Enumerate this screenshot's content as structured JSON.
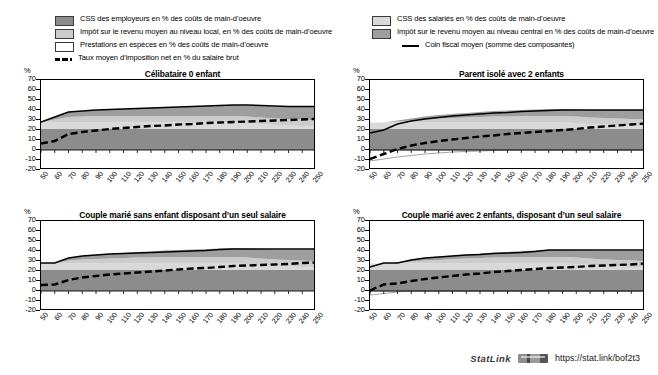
{
  "legend": {
    "left_items": [
      {
        "swatch": "dark-gray",
        "label": "CSS des employeurs en % des coûts de main-d’oeuvre"
      },
      {
        "swatch": "light-gray",
        "label": "Impôt sur le revenu moyen au niveau local, en % des coûts de main-d’oeuvre"
      },
      {
        "swatch": "white",
        "label": "Prestations en espèces en % des coûts de main-d’oeuvre"
      },
      {
        "swatch": "dashed-line",
        "label": "Taux moyen d’imposition net en % du salaire brut"
      }
    ],
    "right_items": [
      {
        "swatch": "lighter-gray",
        "label": "CSS des salariés en % des coûts de main-d’oeuvre"
      },
      {
        "swatch": "mid-gray",
        "label": "Impôt sur le revenu moyen au niveau central en %  des coûts de main-d’oeuvre"
      },
      {
        "swatch": "solid-line",
        "label": "Coin fiscal moyen (somme des composantes)"
      }
    ]
  },
  "footer": {
    "statlink_word": "StatLink",
    "url": "https://stat.link/bof2t3"
  },
  "axis": {
    "unit": "%",
    "yticks": [
      "70",
      "60",
      "50",
      "40",
      "30",
      "20",
      "10",
      "0",
      "-10",
      "-20"
    ],
    "xticks": [
      "50",
      "60",
      "70",
      "80",
      "90",
      "100",
      "110",
      "120",
      "130",
      "140",
      "150",
      "160",
      "170",
      "180",
      "190",
      "200",
      "210",
      "220",
      "230",
      "240",
      "250"
    ]
  },
  "chart_data": {
    "type": "area",
    "xlabel": "",
    "ylabel": "%",
    "xlim": [
      50,
      250
    ],
    "ylim": [
      -20,
      70
    ],
    "grid": false,
    "legend_position": "top",
    "x": [
      50,
      60,
      70,
      80,
      90,
      100,
      110,
      120,
      130,
      140,
      150,
      160,
      170,
      180,
      190,
      200,
      210,
      220,
      230,
      240,
      250
    ],
    "colors": {
      "employer_ssc": "#8c8c8c",
      "employee_ssc": "#d9d9d9",
      "income_tax_central": "#9e9e9e",
      "income_tax_local": "#cccccc",
      "cash_benefits": "#ffffff",
      "net_tax_rate_line": "#000000",
      "tax_wedge_line": "#000000"
    },
    "panels": [
      {
        "title": "Célibataire 0 enfant",
        "series": [
          {
            "name": "CSS des employeurs en % des coûts de main-d’oeuvre",
            "key": "employer_ssc",
            "stack": "positive",
            "values": [
              21,
              21,
              21,
              21,
              21,
              21,
              21,
              21,
              21,
              21,
              21,
              21,
              21,
              21,
              21,
              21,
              21,
              21,
              21,
              21,
              21
            ]
          },
          {
            "name": "CSS des salariés en % des coûts de main-d’oeuvre",
            "key": "employee_ssc",
            "stack": "positive",
            "values": [
              6.5,
              6.5,
              6.5,
              6.5,
              6.5,
              6.5,
              6.5,
              6.5,
              6.5,
              6.5,
              6.5,
              6.5,
              6.5,
              6.5,
              6.5,
              6,
              5,
              4,
              3.5,
              3,
              2.5
            ]
          },
          {
            "name": "Impôt sur le revenu moyen au niveau local, en % des coûts de main-d’oeuvre",
            "key": "income_tax_local",
            "stack": "positive",
            "values": [
              0.5,
              3,
              5.5,
              6,
              6.5,
              6.5,
              6.5,
              6.5,
              6.5,
              6.5,
              6.5,
              6.5,
              6.5,
              6.5,
              6.5,
              6.5,
              6.5,
              6.5,
              6.5,
              6.5,
              6.5
            ]
          },
          {
            "name": "Impôt sur le revenu moyen au niveau central en %  des coûts de main-d’oeuvre",
            "key": "income_tax_central",
            "stack": "positive",
            "values": [
              0,
              2.5,
              5,
              5.5,
              6,
              6.5,
              7,
              7.5,
              8,
              8.5,
              9,
              9.5,
              10,
              10.5,
              11,
              11,
              11.5,
              12,
              12.5,
              13,
              13.5
            ]
          },
          {
            "name": "Prestations en espèces en % des coûts de main-d’oeuvre",
            "key": "cash_benefits",
            "stack": "negative",
            "values": [
              0,
              0,
              0,
              0,
              0,
              0,
              0,
              0,
              0,
              0,
              0,
              0,
              0,
              0,
              0,
              0,
              0,
              0,
              0,
              0,
              0
            ]
          }
        ],
        "lines": [
          {
            "name": "Coin fiscal moyen (somme des composantes)",
            "key": "tax_wedge_line",
            "style": "solid",
            "values": [
              28,
              33,
              38,
              39,
              40,
              40.5,
              41,
              41.5,
              42,
              42.5,
              43,
              43.5,
              44,
              44.5,
              45,
              45,
              44.5,
              44,
              43.5,
              43.5,
              43.5
            ]
          },
          {
            "name": "Taux moyen d’imposition net en % du salaire brut",
            "key": "net_tax_rate_line",
            "style": "dashed",
            "values": [
              6.5,
              9,
              16,
              18,
              19.5,
              21,
              22,
              23,
              24,
              24.5,
              25.5,
              26,
              27,
              27.5,
              28,
              28.5,
              29,
              29.5,
              30,
              30.5,
              31
            ]
          }
        ]
      },
      {
        "title": "Parent isolé avec 2 enfants",
        "series": [
          {
            "name": "CSS des employeurs en % des coûts de main-d’oeuvre",
            "key": "employer_ssc",
            "stack": "positive",
            "values": [
              21,
              21,
              21,
              21,
              21,
              21,
              21,
              21,
              21,
              21,
              21,
              21,
              21,
              21,
              21,
              21,
              21,
              21,
              21,
              21,
              21
            ]
          },
          {
            "name": "CSS des salariés en % des coûts de main-d’oeuvre",
            "key": "employee_ssc",
            "stack": "positive",
            "values": [
              6.5,
              6.5,
              6.5,
              6.5,
              6.5,
              6.5,
              6.5,
              6.5,
              6.5,
              6.5,
              6.5,
              6.5,
              6.5,
              6.5,
              6.5,
              6,
              5,
              4.5,
              4,
              3.5,
              3
            ]
          },
          {
            "name": "Impôt sur le revenu moyen au niveau local, en % des coûts de main-d’oeuvre",
            "key": "income_tax_local",
            "stack": "positive",
            "values": [
              0,
              0,
              1,
              2,
              3,
              4,
              4.5,
              5,
              5.5,
              6,
              6,
              6.5,
              6.5,
              6.5,
              6.5,
              6.5,
              6.5,
              6.5,
              6.5,
              6.5,
              6.5
            ]
          },
          {
            "name": "Impôt sur le revenu moyen au niveau central en %  des coûts de main-d’oeuvre",
            "key": "income_tax_central",
            "stack": "positive",
            "values": [
              0,
              0,
              1,
              2,
              3,
              3.5,
              4,
              4.5,
              5,
              5.5,
              6,
              6,
              6.5,
              7,
              7,
              7,
              7.5,
              8,
              8.5,
              9,
              9.5
            ]
          },
          {
            "name": "Prestations en espèces en % des coûts de main-d’oeuvre",
            "key": "cash_benefits",
            "stack": "negative",
            "values": [
              -11,
              -9,
              -7,
              -5.5,
              -4,
              -3,
              -2,
              -1.5,
              -1,
              -0.5,
              0,
              0,
              0,
              0,
              0,
              0,
              0,
              0,
              0,
              0,
              0
            ]
          }
        ],
        "lines": [
          {
            "name": "Coin fiscal moyen (somme des composantes)",
            "key": "tax_wedge_line",
            "style": "solid",
            "values": [
              17,
              20,
              26,
              29,
              31,
              32.5,
              34,
              35,
              36,
              37,
              37.5,
              38.5,
              39,
              39.5,
              40,
              40,
              40,
              40,
              40,
              40,
              40
            ]
          },
          {
            "name": "Taux moyen d’imposition net en % du salaire brut",
            "key": "net_tax_rate_line",
            "style": "dashed",
            "values": [
              -9,
              -4,
              1,
              4.5,
              7,
              9,
              10.5,
              12,
              13.5,
              14.5,
              16,
              17,
              18,
              19,
              20,
              21,
              22.5,
              23.5,
              24.5,
              25.5,
              26.5
            ]
          }
        ]
      },
      {
        "title": "Couple marié sans enfant disposant d’un seul salaire",
        "series": [
          {
            "name": "CSS des employeurs en % des coûts de main-d’oeuvre",
            "key": "employer_ssc",
            "stack": "positive",
            "values": [
              21,
              21,
              21,
              21,
              21,
              21,
              21,
              21,
              21,
              21,
              21,
              21,
              21,
              21,
              21,
              21,
              21,
              21,
              21,
              21,
              21
            ]
          },
          {
            "name": "CSS des salariés en % des coûts de main-d’oeuvre",
            "key": "employee_ssc",
            "stack": "positive",
            "values": [
              6.5,
              6.5,
              6.5,
              6.5,
              6.5,
              6.5,
              6.5,
              6.5,
              6.5,
              6.5,
              6.5,
              6.5,
              6.5,
              6.5,
              6.5,
              6,
              5,
              4,
              3.5,
              3,
              2.5
            ]
          },
          {
            "name": "Impôt sur le revenu moyen au niveau local, en % des coûts de main-d’oeuvre",
            "key": "income_tax_local",
            "stack": "positive",
            "values": [
              0.5,
              0.5,
              3,
              4,
              4.5,
              5,
              5.5,
              6,
              6,
              6.5,
              6.5,
              6.5,
              6.5,
              6.5,
              6.5,
              6.5,
              6.5,
              6.5,
              6.5,
              6.5,
              6.5
            ]
          },
          {
            "name": "Impôt sur le revenu moyen au niveau central en %  des coûts de main-d’oeuvre",
            "key": "income_tax_central",
            "stack": "positive",
            "values": [
              0,
              0,
              2.5,
              3.5,
              4,
              4.5,
              5,
              5.5,
              6,
              6.5,
              7,
              7.5,
              8,
              8.5,
              9,
              9,
              9.5,
              10,
              10.5,
              11,
              11.5
            ]
          },
          {
            "name": "Prestations en espèces en % des coûts de main-d’oeuvre",
            "key": "cash_benefits",
            "stack": "negative",
            "values": [
              0,
              0,
              0,
              0,
              0,
              0,
              0,
              0,
              0,
              0,
              0,
              0,
              0,
              0,
              0,
              0,
              0,
              0,
              0,
              0,
              0
            ]
          }
        ],
        "lines": [
          {
            "name": "Coin fiscal moyen (somme des composantes)",
            "key": "tax_wedge_line",
            "style": "solid",
            "values": [
              28,
              28,
              33,
              35,
              36,
              37,
              37.5,
              38,
              38.5,
              39,
              39.5,
              40,
              40.5,
              41.5,
              42,
              42,
              42,
              42,
              42,
              42,
              42
            ]
          },
          {
            "name": "Taux moyen d’imposition net en % du salaire brut",
            "key": "net_tax_rate_line",
            "style": "dashed",
            "values": [
              6,
              6.5,
              11,
              13.5,
              15,
              16.5,
              17.5,
              18.5,
              19.5,
              20.5,
              21.5,
              22.5,
              23,
              24,
              25,
              25.5,
              26,
              26.5,
              27,
              28,
              28.5
            ]
          }
        ]
      },
      {
        "title": "Couple marié avec 2 enfants, disposant d’un seul salaire",
        "series": [
          {
            "name": "CSS des employeurs en % des coûts de main-d’oeuvre",
            "key": "employer_ssc",
            "stack": "positive",
            "values": [
              21,
              21,
              21,
              21,
              21,
              21,
              21,
              21,
              21,
              21,
              21,
              21,
              21,
              21,
              21,
              21,
              21,
              21,
              21,
              21,
              21
            ]
          },
          {
            "name": "CSS des salariés en % des coûts de main-d’oeuvre",
            "key": "employee_ssc",
            "stack": "positive",
            "values": [
              6.5,
              6.5,
              6.5,
              6.5,
              6.5,
              6.5,
              6.5,
              6.5,
              6.5,
              6.5,
              6.5,
              6.5,
              6.5,
              6.5,
              6.5,
              6,
              5,
              4,
              3.5,
              3,
              2.5
            ]
          },
          {
            "name": "Impôt sur le revenu moyen au niveau local, en % des coûts de main-d’oeuvre",
            "key": "income_tax_local",
            "stack": "positive",
            "values": [
              0,
              0,
              0.5,
              2,
              3,
              3.5,
              4.5,
              5,
              5.5,
              6,
              6,
              6.5,
              6.5,
              6.5,
              6.5,
              6.5,
              6.5,
              6.5,
              6.5,
              6.5,
              6.5
            ]
          },
          {
            "name": "Impôt sur le revenu moyen au niveau central en %  des coûts de main-d’oeuvre",
            "key": "income_tax_central",
            "stack": "positive",
            "values": [
              0,
              0,
              0.5,
              2,
              2.5,
              3,
              3.5,
              4,
              4.5,
              5,
              5.5,
              6,
              6.5,
              7,
              7,
              7,
              8,
              8.5,
              9,
              9.5,
              10
            ]
          },
          {
            "name": "Prestations en espèces en % des coûts de main-d’oeuvre",
            "key": "cash_benefits",
            "stack": "negative",
            "values": [
              -4,
              -2.5,
              -1,
              0,
              0,
              0,
              0,
              0,
              0,
              0,
              0,
              0,
              0,
              0,
              0,
              0,
              0,
              0,
              0,
              0,
              0
            ]
          }
        ],
        "lines": [
          {
            "name": "Coin fiscal moyen (somme des composantes)",
            "key": "tax_wedge_line",
            "style": "solid",
            "values": [
              24,
              28,
              28,
              31,
              33,
              34,
              35,
              36,
              36.5,
              37.5,
              38,
              38.5,
              39.5,
              41,
              41,
              41,
              41,
              41,
              41,
              41,
              41
            ]
          },
          {
            "name": "Taux moyen d’imposition net en % du salaire brut",
            "key": "net_tax_rate_line",
            "style": "dashed",
            "values": [
              0.5,
              6.5,
              7.5,
              10,
              12,
              13.5,
              15,
              16.5,
              17.5,
              19,
              20,
              21,
              22,
              23,
              23.5,
              24,
              25,
              25.5,
              26,
              26.5,
              27.5
            ]
          }
        ]
      }
    ]
  }
}
